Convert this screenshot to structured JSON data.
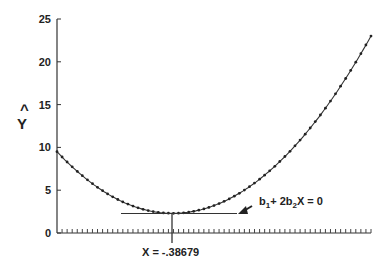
{
  "chart_data": {
    "type": "line",
    "title": "",
    "xlabel": "",
    "ylabel": "Ŷ",
    "ylim": [
      0,
      25
    ],
    "yticks": [
      0,
      5,
      10,
      15,
      20,
      25
    ],
    "xticks_labeled": false,
    "x_tick_count": 62,
    "grid": false,
    "legend": null,
    "series": [
      {
        "name": "Y-hat quadratic fit",
        "style": "line with dot markers",
        "x_norm": [
          0.0,
          0.1,
          0.2,
          0.3,
          0.37,
          0.45,
          0.55,
          0.65,
          0.75,
          0.85,
          0.95,
          1.0
        ],
        "values": [
          9.5,
          6.3,
          4.2,
          2.8,
          2.3,
          2.6,
          4.0,
          6.6,
          10.3,
          15.0,
          20.5,
          23.0
        ]
      }
    ],
    "minimum": {
      "x_label": "X = -.38679",
      "y": 2.3,
      "x_norm": 0.368
    },
    "annotations": [
      {
        "text_parts": [
          "b",
          "1",
          "+ 2b",
          "2",
          "X = 0"
        ],
        "text": "b1+ 2b2X = 0",
        "arrow_to": "tangent line at minimum"
      },
      {
        "text": "X = -.38679",
        "position": "below x-axis at minimum"
      }
    ]
  },
  "labels": {
    "y_axis": "Y",
    "y_hat_mark": "^",
    "y_ticks": [
      "25",
      "20",
      "15",
      "10",
      "5",
      "0"
    ],
    "x_min_label": "X = -.38679",
    "deriv_b1": "b",
    "deriv_sub1": "1",
    "deriv_mid": "+ 2b",
    "deriv_sub2": "2",
    "deriv_end": "X = 0"
  }
}
